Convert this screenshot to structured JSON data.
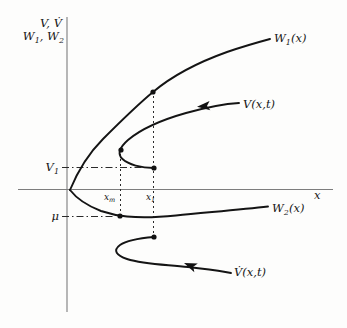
{
  "figure": {
    "background": "#fdfdfc",
    "ink_color": "#141414",
    "axis_color": "#7d7d7d",
    "width": 347,
    "height": 328
  },
  "labels": {
    "y_axis_line1": "V, V̇",
    "y_axis_line2": {
      "p1": "W",
      "s1": "1",
      "p2": ", W",
      "s2": "2"
    },
    "x_axis": "x",
    "w1": {
      "main": "W",
      "sub": "1",
      "suffix": "(x)"
    },
    "w2": {
      "main": "W",
      "sub": "2",
      "suffix": "(x)"
    },
    "v": "V(x,t)",
    "vdot": "V̇(x,t)",
    "v1": {
      "main": "V",
      "sub": "1"
    },
    "mu": "μ",
    "xm": {
      "main": "x",
      "sub": "m"
    },
    "x1": {
      "main": "x",
      "sub": "1"
    }
  },
  "geometry": {
    "y_axis": "M 67,17 V 312",
    "x_axis": "M 18,189.5 H 333",
    "w1_curve": "M 70,190 C 77,173 87,155 103,139 C 121,121 136,106 153,92 C 172,76 199,62 227,52 C 243,46.5 257,42.5 270,39",
    "w2_curve": "M 70,190 C 77,199 88,206 101,211 C 110,214 118,215.7 127,216.5 C 141,217.8 156,217.5 176,215.5 C 206,212.5 241,209.5 268,206.5",
    "v_curve": "M 239,103 C 222,104 204,108 186,113 C 163,119.5 141,129 128,140 C 119.5,147.5 117,154 122.5,159 C 128.5,164.5 141,168 154,168",
    "vdot_curve": "M 154,237 C 142,238 127,240 120,245 C 112.5,250.5 116.5,255.5 127,259 C 144,264.5 166,264.5 188,267 C 204,269 219,270.5 231,273",
    "v_arrow_transform": "translate(197,106.8) rotate(-5)",
    "vdot_arrow_transform": "translate(184,263) rotate(22)",
    "guide_v1": "M 62,167.5 H 150",
    "guide_mu": "M 62,216.5 H 115",
    "guide_xm": "M 120.5,154 V 214",
    "guide_x1": "M 153.5,96 V 234",
    "dot_w1_at_x1": "M 150.4,92 a 2.6,2.6 0 1 0 5.2,0 a 2.6,2.6 0 1 0 -5.2,0",
    "dot_v_tip_at_xm": "M 118.4,150 a 2.6,2.6 0 1 0 5.2,0 a 2.6,2.6 0 1 0 -5.2,0",
    "dot_v_end_at_x1": "M 151.4,168 a 2.6,2.6 0 1 0 5.2,0 a 2.6,2.6 0 1 0 -5.2,0",
    "dot_w2_at_xm": "M 117.4,216 a 2.6,2.6 0 1 0 5.2,0 a 2.6,2.6 0 1 0 -5.2,0",
    "dot_vdot_end_at_x1": "M 151.4,237 a 2.6,2.6 0 1 0 5.2,0 a 2.6,2.6 0 1 0 -5.2,0"
  },
  "key_points": {
    "origin": {
      "x": 70,
      "y": 190
    },
    "w1_at_x1": {
      "x": 153,
      "y": 92
    },
    "v_tip_at_xm": {
      "x": 121,
      "y": 150
    },
    "v_end_at_x1": {
      "x": 154,
      "y": 168
    },
    "w2_at_xm": {
      "x": 120,
      "y": 216
    },
    "vdot_end_at_x1": {
      "x": 154,
      "y": 237
    }
  }
}
